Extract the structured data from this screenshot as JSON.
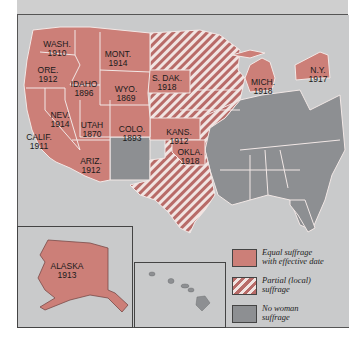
{
  "header": {
    "text_partial": ""
  },
  "colors": {
    "equal": "#cc7f78",
    "partial_stripe": "#b86b68",
    "none": "#8d8f92",
    "water": "#c9cacb",
    "border": "#f2e8e6"
  },
  "states": [
    {
      "name": "WASH.",
      "year": "1910",
      "x": 57,
      "y": 40
    },
    {
      "name": "ORE.",
      "year": "1912",
      "x": 48,
      "y": 66
    },
    {
      "name": "IDAHO",
      "year": "1896",
      "x": 84,
      "y": 80
    },
    {
      "name": "MONT.",
      "year": "1914",
      "x": 118,
      "y": 50
    },
    {
      "name": "WYO.",
      "year": "1869",
      "x": 126,
      "y": 85
    },
    {
      "name": "S. DAK.",
      "year": "1918",
      "x": 167,
      "y": 74
    },
    {
      "name": "NEV.",
      "year": "1914",
      "x": 60,
      "y": 111
    },
    {
      "name": "UTAH",
      "year": "1870",
      "x": 92,
      "y": 121
    },
    {
      "name": "COLO.",
      "year": "1893",
      "x": 132,
      "y": 125
    },
    {
      "name": "KANS.",
      "year": "1912",
      "x": 179,
      "y": 130
    },
    {
      "name": "CALIF.",
      "year": "1911",
      "x": 39,
      "y": 133
    },
    {
      "name": "ARIZ.",
      "year": "1912",
      "x": 91,
      "y": 157
    },
    {
      "name": "OKLA.",
      "year": "1918",
      "x": 190,
      "y": 150
    },
    {
      "name": "MICH.",
      "year": "1918",
      "x": 263,
      "y": 80
    },
    {
      "name": "N.Y.",
      "year": "1917",
      "x": 318,
      "y": 68
    },
    {
      "name": "ALASKA",
      "year": "1913",
      "x": 67,
      "y": 262
    }
  ],
  "legend": {
    "items": [
      {
        "label_line1": "Equal suffrage",
        "label_line2": "with effective date",
        "type": "equal"
      },
      {
        "label_line1": "Partial (local)",
        "label_line2": "suffrage",
        "type": "partial"
      },
      {
        "label_line1": "No woman",
        "label_line2": "suffrage",
        "type": "none"
      }
    ]
  }
}
